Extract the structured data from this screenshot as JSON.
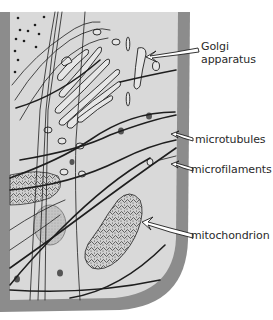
{
  "diagram": {
    "colors": {
      "cytoplasm": "#d9d9d9",
      "cell_wall": "#8c8c8c",
      "outline": "#1e1e1e",
      "organelle_fill": "#e6e6e6",
      "background": "#ffffff"
    },
    "labels": [
      {
        "id": "golgi",
        "line1": "Golgi",
        "line2": "apparatus"
      },
      {
        "id": "microtubules",
        "text": "microtubules"
      },
      {
        "id": "microfilaments",
        "text": "microfilaments"
      },
      {
        "id": "mitochondrion",
        "text": "mitochondrion"
      }
    ]
  }
}
